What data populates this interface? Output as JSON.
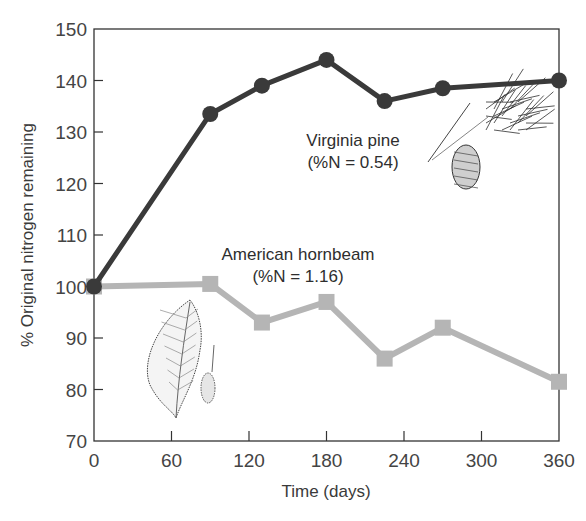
{
  "chart_data": {
    "type": "line",
    "title": "",
    "xlabel": "Time (days)",
    "ylabel": "% Original nitrogen remaining",
    "xlim": [
      0,
      360
    ],
    "ylim": [
      70,
      150
    ],
    "x_ticks": [
      0,
      60,
      120,
      180,
      240,
      300,
      360
    ],
    "y_ticks": [
      70,
      80,
      90,
      100,
      110,
      120,
      130,
      140,
      150
    ],
    "grid": false,
    "legend": "none (inline annotations)",
    "series": [
      {
        "name": "Virginia pine",
        "annotation": [
          "Virginia pine",
          "(%N = 0.54)"
        ],
        "marker": "circle",
        "color": "#3a3a3a",
        "x": [
          0,
          90,
          130,
          180,
          225,
          270,
          360
        ],
        "values": [
          100,
          133.5,
          139,
          144,
          136,
          138.5,
          140
        ]
      },
      {
        "name": "American hornbeam",
        "annotation": [
          "American hornbeam",
          "(%N = 1.16)"
        ],
        "marker": "square",
        "color": "#b5b5b5",
        "x": [
          0,
          90,
          130,
          180,
          225,
          270,
          360
        ],
        "values": [
          100,
          100.5,
          93,
          97,
          86,
          92,
          81.5
        ]
      }
    ],
    "illustrations": [
      "pine needles and cone",
      "hornbeam leaf and fruit"
    ]
  }
}
